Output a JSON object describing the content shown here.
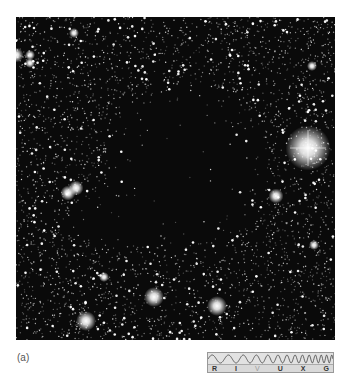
{
  "figure": {
    "panel_label": "(a)",
    "photo": {
      "subject": "dark-molecular-cloud-star-field",
      "background_color": "#0a0a0a",
      "star_color": "#ffffff",
      "bright_stars": [
        {
          "x": 292,
          "y": 131,
          "r": 9
        },
        {
          "x": 138,
          "y": 280,
          "r": 4
        },
        {
          "x": 70,
          "y": 304,
          "r": 4
        },
        {
          "x": 60,
          "y": 171,
          "r": 3
        },
        {
          "x": 52,
          "y": 176,
          "r": 3
        },
        {
          "x": 0,
          "y": 38,
          "r": 3
        },
        {
          "x": 201,
          "y": 289,
          "r": 4
        },
        {
          "x": 14,
          "y": 38,
          "r": 2
        },
        {
          "x": 58,
          "y": 16,
          "r": 2
        },
        {
          "x": 260,
          "y": 179,
          "r": 3
        },
        {
          "x": 88,
          "y": 260,
          "r": 2
        },
        {
          "x": 296,
          "y": 49,
          "r": 2
        },
        {
          "x": 298,
          "y": 228,
          "r": 2
        },
        {
          "x": 14,
          "y": 46,
          "r": 2
        }
      ],
      "dark_cloud": {
        "cx": 170,
        "cy": 150,
        "rx": 80,
        "ry": 85
      }
    },
    "spectrum_indicator": {
      "bands": [
        {
          "label": "R",
          "active": true
        },
        {
          "label": "I",
          "active": true
        },
        {
          "label": "V",
          "active": false
        },
        {
          "label": "U",
          "active": true
        },
        {
          "label": "X",
          "active": true
        },
        {
          "label": "G",
          "active": true
        }
      ]
    }
  }
}
